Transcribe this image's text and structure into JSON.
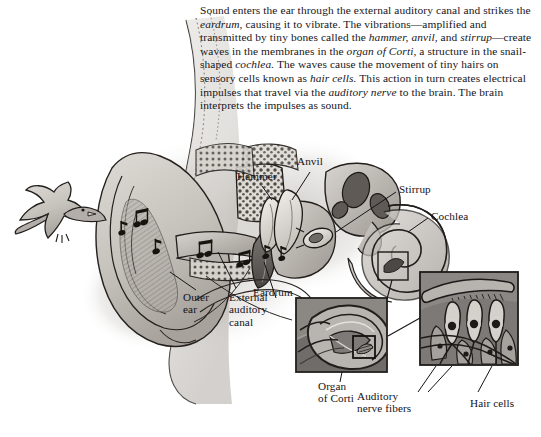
{
  "document": {
    "title": "How the ear hears sound",
    "type": "anatomical-illustration"
  },
  "caption": {
    "html": "Sound enters the ear through the external auditory canal and strikes the <em>eardrum,</em> causing it to vibrate. The vibrations—amplified and transmitted by tiny bones called the <em>hammer, anvil,</em> and <em>stirrup</em>—create waves in the membranes in the <em>organ of Corti,</em> a structure in the snail-shaped <em>cochlea.</em> The waves cause the movement of tiny hairs on sensory cells known as <em>hair cells.</em> This action in turn creates electrical impulses that travel via the <em>auditory nerve</em> to the brain. The brain interprets the impulses as sound.",
    "plain": "Sound enters the ear through the external auditory canal and strikes the eardrum, causing it to vibrate. The vibrations—amplified and transmitted by tiny bones called the hammer, anvil, and stirrup—create waves in the membranes in the organ of Corti, a structure in the snail-shaped cochlea. The waves cause the movement of tiny hairs on sensory cells known as hair cells. This action in turn creates electrical impulses that travel via the auditory nerve to the brain. The brain interprets the impulses as sound."
  },
  "labels": {
    "hammer": "Hammer",
    "anvil": "Anvil",
    "stirrup": "Stirrup",
    "cochlea": "Cochlea",
    "eardrum": "Eardrum",
    "outer_ear": "Outer\near",
    "external_auditory_canal": "External\nauditory\ncanal",
    "organ_of_corti": "Organ\nof Corti",
    "auditory_nerve_fibers": "Auditory\nnerve fibers",
    "hair_cells": "Hair cells"
  },
  "figure_elements": {
    "sound_source": "bird",
    "sound_symbols": "music-notes",
    "insets": [
      {
        "name": "organ-of-corti-inset",
        "caption_key": "organ_of_corti"
      },
      {
        "name": "hair-cells-inset",
        "caption_keys": [
          "auditory_nerve_fibers",
          "hair_cells"
        ]
      }
    ]
  },
  "palette": {
    "paper": "#ffffff",
    "ink": "#181418",
    "tissue_light": "#cfcbc6",
    "tissue_mid": "#a6a19c",
    "tissue_dark": "#6f6a66",
    "tissue_deep": "#3f3b38",
    "bone_light": "#e7e4df",
    "inset_bg": "#8d8d8d"
  }
}
